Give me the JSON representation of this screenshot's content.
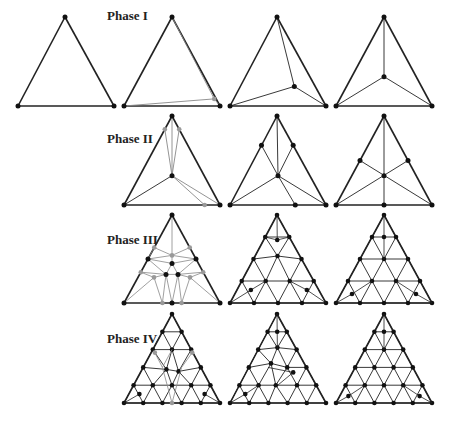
{
  "labels": [
    {
      "text": "Phase I",
      "x": 107,
      "y": 8
    },
    {
      "text": "Phase II",
      "x": 107,
      "y": 131
    },
    {
      "text": "Phase III",
      "x": 107,
      "y": 232
    },
    {
      "text": "Phase IV",
      "x": 107,
      "y": 331
    }
  ],
  "colors": {
    "edge": "#222222",
    "new_edge": "#888888",
    "node": "#111111",
    "new_node": "#999999"
  },
  "triangles": [
    {
      "id": "p1-s1",
      "phase": "Phase I",
      "top": [
        65,
        17
      ],
      "bl": [
        18,
        106
      ],
      "br": [
        114,
        106
      ],
      "nodes": [
        [
          0.5,
          0
        ],
        [
          0,
          1
        ],
        [
          1,
          1
        ]
      ],
      "gray_nodes": [],
      "edges": [],
      "gray_edges": []
    },
    {
      "id": "p1-s2",
      "phase": "Phase I",
      "top": [
        172,
        17
      ],
      "bl": [
        124,
        106
      ],
      "br": [
        220,
        106
      ],
      "nodes": [
        [
          0.5,
          0
        ],
        [
          0,
          1
        ],
        [
          1,
          1
        ]
      ],
      "gray_nodes": [
        [
          0.94,
          0.92
        ]
      ],
      "edges": [],
      "gray_edges": [
        [
          [
            0.5,
            0
          ],
          [
            0.94,
            0.92
          ]
        ],
        [
          [
            0,
            1
          ],
          [
            0.94,
            0.92
          ]
        ],
        [
          [
            1,
            1
          ],
          [
            0.94,
            0.92
          ]
        ]
      ]
    },
    {
      "id": "p1-s3",
      "phase": "Phase I",
      "top": [
        277,
        17
      ],
      "bl": [
        230,
        106
      ],
      "br": [
        326,
        106
      ],
      "nodes": [
        [
          0.5,
          0
        ],
        [
          0,
          1
        ],
        [
          1,
          1
        ],
        [
          0.67,
          0.78
        ]
      ],
      "gray_nodes": [],
      "edges": [
        [
          [
            0.5,
            0
          ],
          [
            0.67,
            0.78
          ]
        ],
        [
          [
            0,
            1
          ],
          [
            0.67,
            0.78
          ]
        ],
        [
          [
            1,
            1
          ],
          [
            0.67,
            0.78
          ]
        ]
      ],
      "gray_edges": []
    },
    {
      "id": "p1-s4",
      "phase": "Phase I",
      "top": [
        384,
        17
      ],
      "bl": [
        336,
        106
      ],
      "br": [
        432,
        106
      ],
      "nodes": [
        [
          0.5,
          0
        ],
        [
          0,
          1
        ],
        [
          1,
          1
        ],
        [
          0.5,
          0.67
        ]
      ],
      "gray_nodes": [],
      "edges": [
        [
          [
            0.5,
            0
          ],
          [
            0.5,
            0.67
          ]
        ],
        [
          [
            0,
            1
          ],
          [
            0.5,
            0.67
          ]
        ],
        [
          [
            1,
            1
          ],
          [
            0.5,
            0.67
          ]
        ]
      ],
      "gray_edges": []
    },
    {
      "id": "p2-s1",
      "phase": "Phase II",
      "top": [
        172,
        116
      ],
      "bl": [
        124,
        205
      ],
      "br": [
        220,
        205
      ],
      "nodes": [
        [
          0.5,
          0
        ],
        [
          0,
          1
        ],
        [
          1,
          1
        ],
        [
          0.5,
          0.67
        ]
      ],
      "gray_nodes": [
        [
          0.42,
          0.15
        ],
        [
          0.58,
          0.15
        ],
        [
          0.84,
          1
        ]
      ],
      "edges": [
        [
          [
            0,
            1
          ],
          [
            0.5,
            0.67
          ]
        ]
      ],
      "gray_edges": [
        [
          [
            0.5,
            0
          ],
          [
            0.5,
            0.67
          ]
        ],
        [
          [
            0.42,
            0.15
          ],
          [
            0.5,
            0.67
          ]
        ],
        [
          [
            0.58,
            0.15
          ],
          [
            0.5,
            0.67
          ]
        ],
        [
          [
            0.5,
            0.67
          ],
          [
            0.84,
            1
          ]
        ],
        [
          [
            0.5,
            0.67
          ],
          [
            1,
            1
          ]
        ]
      ]
    },
    {
      "id": "p2-s2",
      "phase": "Phase II",
      "top": [
        277,
        116
      ],
      "bl": [
        230,
        205
      ],
      "br": [
        326,
        205
      ],
      "nodes": [
        [
          0.5,
          0
        ],
        [
          0,
          1
        ],
        [
          1,
          1
        ],
        [
          0.5,
          0.67
        ],
        [
          0.32,
          0.33
        ],
        [
          0.68,
          0.33
        ],
        [
          0.68,
          1
        ]
      ],
      "gray_nodes": [],
      "edges": [
        [
          [
            0.5,
            0
          ],
          [
            0.5,
            0.67
          ]
        ],
        [
          [
            0.32,
            0.33
          ],
          [
            0.5,
            0.67
          ]
        ],
        [
          [
            0.68,
            0.33
          ],
          [
            0.5,
            0.67
          ]
        ],
        [
          [
            0,
            1
          ],
          [
            0.5,
            0.67
          ]
        ],
        [
          [
            1,
            1
          ],
          [
            0.5,
            0.67
          ]
        ],
        [
          [
            0.5,
            0.67
          ],
          [
            0.68,
            1
          ]
        ]
      ],
      "gray_edges": []
    },
    {
      "id": "p2-s3",
      "phase": "Phase II",
      "top": [
        384,
        116
      ],
      "bl": [
        336,
        205
      ],
      "br": [
        432,
        205
      ],
      "nodes": [
        [
          0.5,
          0
        ],
        [
          0,
          1
        ],
        [
          1,
          1
        ],
        [
          0.5,
          0.67
        ],
        [
          0.25,
          0.5
        ],
        [
          0.75,
          0.5
        ],
        [
          0.5,
          1
        ]
      ],
      "gray_nodes": [],
      "edges": [
        [
          [
            0.5,
            0
          ],
          [
            0.5,
            1
          ]
        ],
        [
          [
            0.25,
            0.5
          ],
          [
            1,
            1
          ]
        ],
        [
          [
            0.75,
            0.5
          ],
          [
            0,
            1
          ]
        ]
      ],
      "gray_edges": []
    },
    {
      "id": "p3-s1",
      "phase": "Phase III",
      "top": [
        172,
        215
      ],
      "bl": [
        124,
        303
      ],
      "br": [
        220,
        303
      ],
      "kind": "p3a"
    },
    {
      "id": "p3-s2",
      "phase": "Phase III",
      "top": [
        277,
        215
      ],
      "bl": [
        230,
        303
      ],
      "br": [
        326,
        303
      ],
      "kind": "p3b"
    },
    {
      "id": "p3-s3",
      "phase": "Phase III",
      "top": [
        384,
        215
      ],
      "bl": [
        336,
        303
      ],
      "br": [
        432,
        303
      ],
      "kind": "p3c"
    },
    {
      "id": "p4-s1",
      "phase": "Phase IV",
      "top": [
        172,
        314
      ],
      "bl": [
        124,
        403
      ],
      "br": [
        220,
        403
      ],
      "kind": "p4a"
    },
    {
      "id": "p4-s2",
      "phase": "Phase IV",
      "top": [
        277,
        314
      ],
      "bl": [
        230,
        403
      ],
      "br": [
        326,
        403
      ],
      "kind": "p4b"
    },
    {
      "id": "p4-s3",
      "phase": "Phase IV",
      "top": [
        384,
        314
      ],
      "bl": [
        336,
        403
      ],
      "br": [
        432,
        403
      ],
      "kind": "p4c"
    }
  ]
}
